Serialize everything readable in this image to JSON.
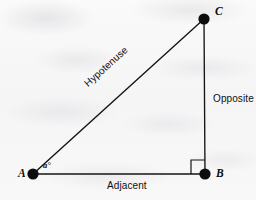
{
  "figure": {
    "kind": "right-triangle-trigonometry-diagram",
    "background_color": "#f7f7f7",
    "stroke_color": "#141414"
  },
  "vertices": {
    "a": {
      "label": "A",
      "x": 33,
      "y": 174
    },
    "b": {
      "label": "B",
      "x": 205,
      "y": 174
    },
    "c": {
      "label": "C",
      "x": 204,
      "y": 19
    }
  },
  "angle": {
    "label": "a°",
    "at_vertex": "A"
  },
  "sides": {
    "hypotenuse": {
      "label": "Hypotenuse",
      "from": "A",
      "to": "C"
    },
    "opposite": {
      "label": "Opposite",
      "from": "B",
      "to": "C"
    },
    "adjacent": {
      "label": "Adjacent",
      "from": "A",
      "to": "B"
    }
  },
  "markers": {
    "right_angle": {
      "at_vertex": "B",
      "size": 14
    }
  }
}
